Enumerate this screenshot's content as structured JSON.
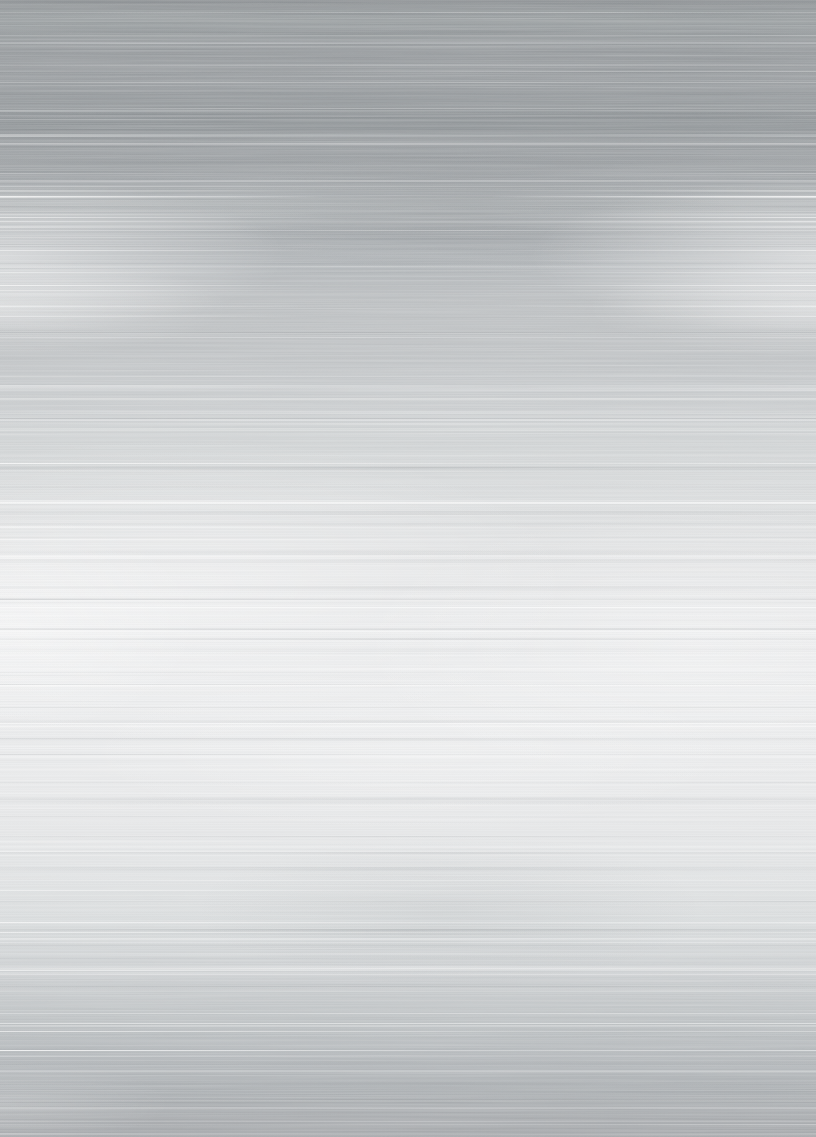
{
  "image": {
    "kind": "photographic texture",
    "subject": "brushed aluminum sheet metal, horizontal grain",
    "width": 816,
    "height": 1137
  },
  "palette": {
    "top_gray": "#8e9295",
    "upper_gray": "#a4a8ab",
    "middle_bright": "#ebeced",
    "lower_gray": "#bfc3c5",
    "bottom_gray": "#a4a7aa",
    "highlight": "#ffffff",
    "shadow": "#585e63"
  },
  "base_gradient_stops": [
    {
      "pos": 0.0,
      "color": "#8e9295"
    },
    {
      "pos": 0.018,
      "color": "#9ba0a2"
    },
    {
      "pos": 0.045,
      "color": "#969a9d"
    },
    {
      "pos": 0.075,
      "color": "#9a9ea1"
    },
    {
      "pos": 0.105,
      "color": "#909598"
    },
    {
      "pos": 0.135,
      "color": "#9da1a4"
    },
    {
      "pos": 0.16,
      "color": "#a4a8ab"
    },
    {
      "pos": 0.18,
      "color": "#b2b6b8"
    },
    {
      "pos": 0.205,
      "color": "#aaaeb1"
    },
    {
      "pos": 0.235,
      "color": "#b3b7ba"
    },
    {
      "pos": 0.265,
      "color": "#bdc0c2"
    },
    {
      "pos": 0.3,
      "color": "#bfc2c4"
    },
    {
      "pos": 0.345,
      "color": "#c8cbcd"
    },
    {
      "pos": 0.395,
      "color": "#d2d5d6"
    },
    {
      "pos": 0.445,
      "color": "#dcdedf"
    },
    {
      "pos": 0.495,
      "color": "#e4e5e6"
    },
    {
      "pos": 0.55,
      "color": "#e9eaeb"
    },
    {
      "pos": 0.615,
      "color": "#ebeced"
    },
    {
      "pos": 0.67,
      "color": "#eaebec"
    },
    {
      "pos": 0.72,
      "color": "#e7e8e9"
    },
    {
      "pos": 0.77,
      "color": "#e2e4e5"
    },
    {
      "pos": 0.815,
      "color": "#d9dcdd"
    },
    {
      "pos": 0.855,
      "color": "#cdd0d2"
    },
    {
      "pos": 0.895,
      "color": "#bfc3c5"
    },
    {
      "pos": 0.93,
      "color": "#b5b9bc"
    },
    {
      "pos": 0.96,
      "color": "#adb1b4"
    },
    {
      "pos": 0.985,
      "color": "#a8abae"
    },
    {
      "pos": 1.0,
      "color": "#a4a7aa"
    }
  ],
  "sheens": [
    {
      "rx": "50%",
      "ry": "110px",
      "cx": "0%",
      "cy": "22.5%",
      "color": "rgba(255,255,255,0.50)"
    },
    {
      "rx": "50%",
      "ry": "110px",
      "cx": "100%",
      "cy": "22.5%",
      "color": "rgba(255,255,255,0.50)"
    },
    {
      "rx": "40%",
      "ry": "70px",
      "cx": "0%",
      "cy": "27%",
      "color": "rgba(255,255,255,0.35)"
    },
    {
      "rx": "40%",
      "ry": "70px",
      "cx": "100%",
      "cy": "27%",
      "color": "rgba(255,255,255,0.35)"
    },
    {
      "rx": "70%",
      "ry": "220px",
      "cx": "22%",
      "cy": "52%",
      "color": "rgba(255,255,255,0.40)"
    },
    {
      "rx": "60%",
      "ry": "200px",
      "cx": "85%",
      "cy": "57%",
      "color": "rgba(255,255,255,0.33)"
    },
    {
      "rx": "35%",
      "ry": "160px",
      "cx": "0%",
      "cy": "55%",
      "color": "rgba(255,255,255,0.45)"
    },
    {
      "rx": "45%",
      "ry": "90px",
      "cx": "58%",
      "cy": "18.5%",
      "color": "rgba(56,62,68,0.10)"
    },
    {
      "rx": "45%",
      "ry": "110px",
      "cx": "55%",
      "cy": "80%",
      "color": "rgba(56,62,68,0.06)"
    },
    {
      "rx": "60%",
      "ry": "120px",
      "cx": "50%",
      "cy": "66%",
      "color": "rgba(255,255,255,0.22)"
    },
    {
      "rx": "30%",
      "ry": "60px",
      "cx": "0%",
      "cy": "97%",
      "color": "rgba(255,255,255,0.16)"
    }
  ],
  "streaks": {
    "seed": 1337,
    "count": 240,
    "white_rgb": "255,255,255",
    "dark_rgb": "88,94,99",
    "edge_band": [
      165,
      345
    ],
    "bright_band": [
      430,
      770
    ],
    "dark_band_count": 22,
    "crisp_jitter": 14,
    "crisp_ys": [
      193,
      205,
      215,
      228,
      262,
      275,
      292,
      306,
      320,
      470,
      490,
      515,
      540,
      565,
      590,
      615,
      640,
      662,
      688,
      710,
      736,
      860,
      885,
      912,
      938,
      962,
      988,
      1012,
      1036,
      1062
    ]
  },
  "noise": {
    "base_frequency": "0.0035 0.8",
    "octaves": 4,
    "seed": 11
  }
}
